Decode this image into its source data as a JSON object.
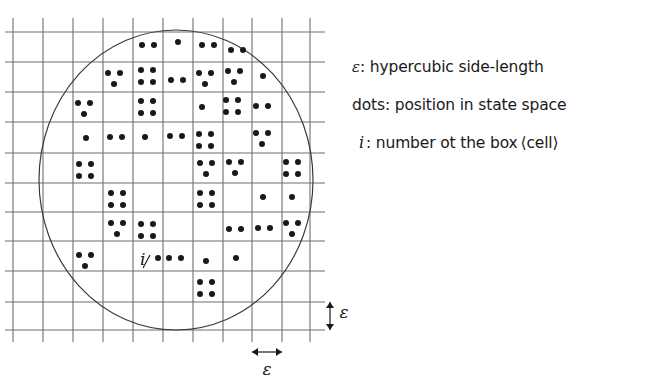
{
  "figure": {
    "kind": "box-counting-diagram",
    "background_color": "#ffffff",
    "ink_color": "#19191b",
    "grid_color": "#6f6f73",
    "curve_color": "#3b3b3f"
  },
  "legend": {
    "entries": [
      {
        "symbol": "ε",
        "separator": ":",
        "text": "hypercubic side-length",
        "symbol_name": "epsilon-symbol"
      },
      {
        "symbol": "dots",
        "separator": ":",
        "text": "position in state space",
        "symbol_name": "dots-word"
      },
      {
        "symbol": "i",
        "separator": ":",
        "text": "number ot the box ⟨cell⟩",
        "symbol_name": "italic-i-symbol"
      }
    ]
  },
  "annotations": {
    "cell_index_label": "i",
    "vertical_scale_label": "ε",
    "horizontal_scale_label": "ε"
  },
  "chart_data": {
    "type": "scatter",
    "title": "",
    "xlabel": "",
    "ylabel": "",
    "grid": true,
    "grid_spacing_px": 30,
    "grid_x_lines": [
      13,
      43,
      73,
      103,
      133,
      163,
      193,
      223,
      252,
      282,
      310
    ],
    "grid_y_lines": [
      32,
      62,
      92,
      122,
      153,
      183,
      212,
      241,
      271,
      302,
      330
    ],
    "grid_x_extent": [
      5,
      325
    ],
    "grid_y_extent": [
      18,
      342
    ],
    "attractor_boundary": {
      "shape": "circle",
      "cx": 176,
      "cy": 180,
      "rx": 137,
      "ry": 150
    },
    "dot_radius_px": 3.0,
    "clusters": [
      {
        "cx": 148,
        "cy": 45,
        "pattern": "two-horizontal"
      },
      {
        "cx": 178,
        "cy": 42,
        "pattern": "one"
      },
      {
        "cx": 208,
        "cy": 45,
        "pattern": "two-horizontal"
      },
      {
        "cx": 237,
        "cy": 50,
        "pattern": "two-horizontal"
      },
      {
        "cx": 114,
        "cy": 78,
        "pattern": "three"
      },
      {
        "cx": 147,
        "cy": 76,
        "pattern": "four"
      },
      {
        "cx": 177,
        "cy": 80,
        "pattern": "two-horizontal"
      },
      {
        "cx": 205,
        "cy": 78,
        "pattern": "three"
      },
      {
        "cx": 234,
        "cy": 76,
        "pattern": "three"
      },
      {
        "cx": 263,
        "cy": 76,
        "pattern": "one"
      },
      {
        "cx": 84,
        "cy": 108,
        "pattern": "three"
      },
      {
        "cx": 147,
        "cy": 107,
        "pattern": "four"
      },
      {
        "cx": 202,
        "cy": 107,
        "pattern": "one"
      },
      {
        "cx": 232,
        "cy": 106,
        "pattern": "four"
      },
      {
        "cx": 262,
        "cy": 106,
        "pattern": "two-horizontal"
      },
      {
        "cx": 86,
        "cy": 138,
        "pattern": "one"
      },
      {
        "cx": 116,
        "cy": 137,
        "pattern": "two-horizontal"
      },
      {
        "cx": 145,
        "cy": 137,
        "pattern": "one"
      },
      {
        "cx": 176,
        "cy": 136,
        "pattern": "two-horizontal"
      },
      {
        "cx": 205,
        "cy": 140,
        "pattern": "four"
      },
      {
        "cx": 262,
        "cy": 138,
        "pattern": "three"
      },
      {
        "cx": 85,
        "cy": 170,
        "pattern": "four"
      },
      {
        "cx": 206,
        "cy": 168,
        "pattern": "three"
      },
      {
        "cx": 235,
        "cy": 167,
        "pattern": "three"
      },
      {
        "cx": 292,
        "cy": 168,
        "pattern": "four"
      },
      {
        "cx": 117,
        "cy": 199,
        "pattern": "four"
      },
      {
        "cx": 206,
        "cy": 199,
        "pattern": "four"
      },
      {
        "cx": 263,
        "cy": 197,
        "pattern": "one"
      },
      {
        "cx": 292,
        "cy": 197,
        "pattern": "one"
      },
      {
        "cx": 117,
        "cy": 228,
        "pattern": "three"
      },
      {
        "cx": 147,
        "cy": 230,
        "pattern": "four"
      },
      {
        "cx": 235,
        "cy": 229,
        "pattern": "two-horizontal"
      },
      {
        "cx": 264,
        "cy": 228,
        "pattern": "two-horizontal"
      },
      {
        "cx": 292,
        "cy": 228,
        "pattern": "three"
      },
      {
        "cx": 85,
        "cy": 260,
        "pattern": "three"
      },
      {
        "cx": 158,
        "cy": 258,
        "pattern": "one"
      },
      {
        "cx": 175,
        "cy": 258,
        "pattern": "two-horizontal"
      },
      {
        "cx": 206,
        "cy": 261,
        "pattern": "one"
      },
      {
        "cx": 236,
        "cy": 258,
        "pattern": "one"
      },
      {
        "cx": 206,
        "cy": 288,
        "pattern": "four"
      }
    ],
    "cluster_patterns": {
      "one": [
        [
          0,
          0
        ]
      ],
      "two-horizontal": [
        [
          -6,
          0
        ],
        [
          6,
          0
        ]
      ],
      "three": [
        [
          -6,
          -5
        ],
        [
          6,
          -5
        ],
        [
          0,
          6
        ]
      ],
      "four": [
        [
          -6,
          -6
        ],
        [
          6,
          -6
        ],
        [
          -6,
          6
        ],
        [
          6,
          6
        ]
      ]
    },
    "scale_bars": [
      {
        "name": "vertical-epsilon",
        "orientation": "vertical",
        "x": 330,
        "y1": 302,
        "y2": 330,
        "label": "ε",
        "label_x": 344,
        "label_y": 318
      },
      {
        "name": "horizontal-epsilon",
        "orientation": "horizontal",
        "y": 352,
        "x1": 252,
        "x2": 282,
        "label": "ε",
        "label_x": 267,
        "label_y": 375
      }
    ],
    "pointer": {
      "name": "i-pointer",
      "from_x": 143,
      "from_y": 268,
      "to_x": 150,
      "to_y": 255
    }
  }
}
